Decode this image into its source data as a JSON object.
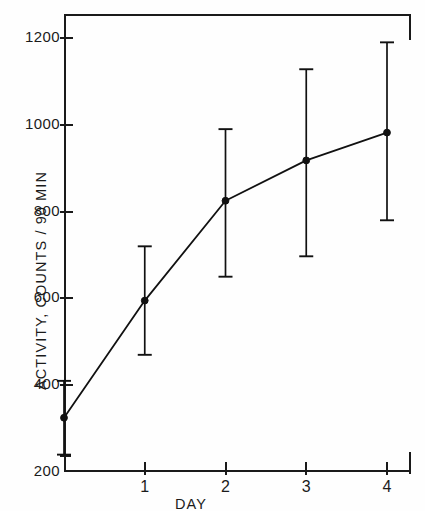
{
  "chart_data": {
    "type": "line",
    "title": "",
    "subtitle": "",
    "xlabel": "DAY",
    "ylabel": "ACTIVITY, COUNTS / 90 MIN",
    "xlim": [
      -0.92,
      4.3
    ],
    "ylim": [
      200,
      1285
    ],
    "xticks": [
      1,
      2,
      3,
      4
    ],
    "xtick_labels": [
      "1",
      "2",
      "3",
      "4"
    ],
    "yticks": [
      200,
      400,
      600,
      800,
      1000,
      1200
    ],
    "ytick_labels": [
      "200",
      "400",
      "600",
      "800",
      "1000",
      "1200"
    ],
    "grid": false,
    "legend": null,
    "legend_position": "none",
    "marker": "filled-circle",
    "line_color": "#111111",
    "marker_color": "#111111",
    "errorbar_color": "#111111",
    "x": [
      0,
      1,
      2,
      3,
      4
    ],
    "values": [
      325,
      595,
      825,
      918,
      982
    ],
    "error_low": [
      240,
      470,
      650,
      697,
      780
    ],
    "error_high": [
      410,
      720,
      990,
      1128,
      1190
    ],
    "series": [
      {
        "name": "Activity",
        "points": [
          {
            "x": 0,
            "y": 325,
            "low": 240,
            "high": 410
          },
          {
            "x": 1,
            "y": 595,
            "low": 470,
            "high": 720
          },
          {
            "x": 2,
            "y": 825,
            "low": 650,
            "high": 990
          },
          {
            "x": 3,
            "y": 918,
            "low": 697,
            "high": 1128
          },
          {
            "x": 4,
            "y": 982,
            "low": 780,
            "high": 1190
          }
        ]
      }
    ],
    "annotations": []
  }
}
